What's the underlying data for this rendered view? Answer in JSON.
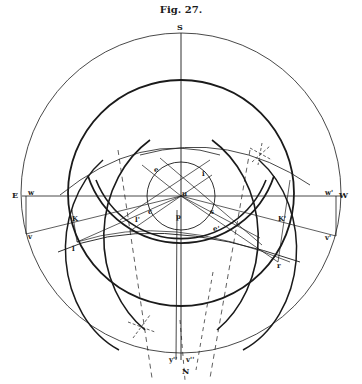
{
  "figure": {
    "title": "Fig. 27.",
    "compass": {
      "top": "S",
      "bottom": "N",
      "left": "E",
      "right": "W"
    },
    "labels": {
      "u": "u",
      "e": "e",
      "i": "i",
      "c": "c",
      "s": "s",
      "p": "p",
      "l_prime": "l'",
      "e_prime": "e'",
      "K": "K",
      "K_prime": "K'",
      "l": "l",
      "r": "r",
      "w": "w",
      "v": "v",
      "w_prime": "w'",
      "v_prime": "v'",
      "y_prime_prime": "y''",
      "v_prime_prime": "v''"
    },
    "colors": {
      "ink": "#1a1a1a",
      "paper": "#ffffff"
    }
  }
}
